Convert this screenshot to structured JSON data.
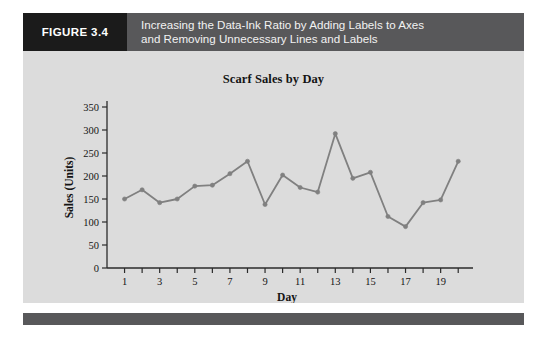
{
  "header": {
    "figure_number": "FIGURE 3.4",
    "caption_line_1": "Increasing the Data-Ink Ratio by Adding Labels to Axes",
    "caption_line_2": "and Removing Unnecessary Lines and Labels",
    "box_color": "#1b1b1b",
    "bar_color": "#58585a",
    "text_color": "#f2f2f2"
  },
  "panel": {
    "background": "#dcdcdc",
    "footer_color": "#58585a"
  },
  "chart_data": {
    "type": "line",
    "title": "Scarf Sales by Day",
    "xlabel": "Day",
    "ylabel": "Sales (Units)",
    "xlim": [
      0,
      20.5
    ],
    "ylim": [
      0,
      350
    ],
    "grid": false,
    "legend": "none",
    "line_color": "#808080",
    "marker": "circle",
    "x": [
      1,
      2,
      3,
      4,
      5,
      6,
      7,
      8,
      9,
      10,
      11,
      12,
      13,
      14,
      15,
      16,
      17,
      18,
      19,
      20
    ],
    "values": [
      150,
      170,
      142,
      150,
      178,
      180,
      205,
      232,
      138,
      202,
      175,
      165,
      292,
      195,
      208,
      112,
      90,
      142,
      148,
      232
    ],
    "ytick_labels": [
      "0",
      "50",
      "100",
      "150",
      "200",
      "250",
      "300",
      "350"
    ],
    "ytick_values": [
      0,
      50,
      100,
      150,
      200,
      250,
      300,
      350
    ],
    "xtick_labels": [
      "1",
      "3",
      "5",
      "7",
      "9",
      "11",
      "13",
      "15",
      "17",
      "19"
    ],
    "xtick_values": [
      1,
      3,
      5,
      7,
      9,
      11,
      13,
      15,
      17,
      19
    ],
    "xtick_minor_values": [
      2,
      4,
      6,
      8,
      10,
      12,
      14,
      16,
      18,
      20
    ]
  }
}
